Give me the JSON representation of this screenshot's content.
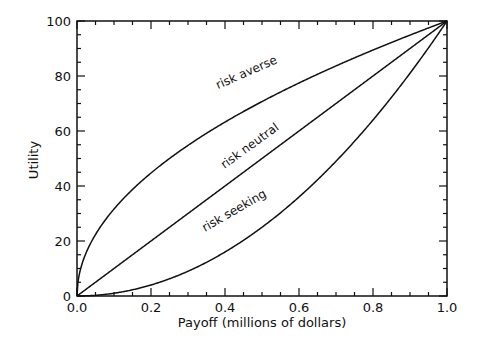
{
  "chart_data": {
    "type": "line",
    "title": "",
    "xlabel": "Payoff (millions of dollars)",
    "ylabel": "Utility",
    "xlim": [
      0.0,
      1.0
    ],
    "ylim": [
      0,
      100
    ],
    "grid": false,
    "legend": "none (curves labeled inline)",
    "x_ticks": [
      "0.0",
      "0.2",
      "0.4",
      "0.6",
      "0.8",
      "1.0"
    ],
    "y_ticks": [
      "0",
      "20",
      "40",
      "60",
      "80",
      "100"
    ],
    "x": [
      0.0,
      0.05,
      0.1,
      0.2,
      0.3,
      0.4,
      0.5,
      0.6,
      0.7,
      0.8,
      0.9,
      1.0
    ],
    "series": [
      {
        "name": "risk averse",
        "values": [
          0,
          22.4,
          31.6,
          44.7,
          54.8,
          63.2,
          70.7,
          77.5,
          83.7,
          89.4,
          94.9,
          100
        ]
      },
      {
        "name": "risk neutral",
        "values": [
          0,
          5,
          10,
          20,
          30,
          40,
          50,
          60,
          70,
          80,
          90,
          100
        ]
      },
      {
        "name": "risk seeking",
        "values": [
          0,
          0.25,
          1,
          4,
          9,
          16,
          25,
          36,
          49,
          64,
          81,
          100
        ]
      }
    ],
    "annotations": [
      {
        "text": "risk averse",
        "x": 0.46,
        "y": 68
      },
      {
        "text": "risk neutral",
        "x": 0.47,
        "y": 48
      },
      {
        "text": "risk seeking",
        "x": 0.44,
        "y": 25
      }
    ]
  }
}
